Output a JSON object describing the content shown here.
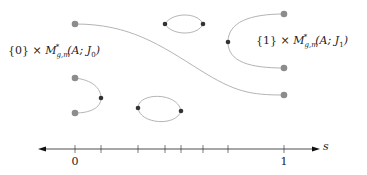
{
  "labels": {
    "left_set": {
      "prefix": "{0} × ",
      "moduli": "M",
      "sup": "*",
      "sub": "g,m",
      "args": "(A; J",
      "j_sub": "0",
      "close": ")"
    },
    "right_set": {
      "prefix": "{1} × ",
      "moduli": "M",
      "sup": "*",
      "sub": "g,m",
      "args": "(A; J",
      "j_sub": "1",
      "close": ")"
    }
  },
  "axis": {
    "variable": "s",
    "tick_labels": [
      {
        "text": "0",
        "x": 75
      },
      {
        "text": "1",
        "x": 284
      }
    ],
    "ticks_x": [
      75,
      101,
      138,
      165,
      181,
      203,
      228,
      284
    ]
  },
  "colors": {
    "curve": "#b4b4b4",
    "endpoint": "#8c8c8c",
    "critical_point": "#333333",
    "axis": "#222222"
  }
}
